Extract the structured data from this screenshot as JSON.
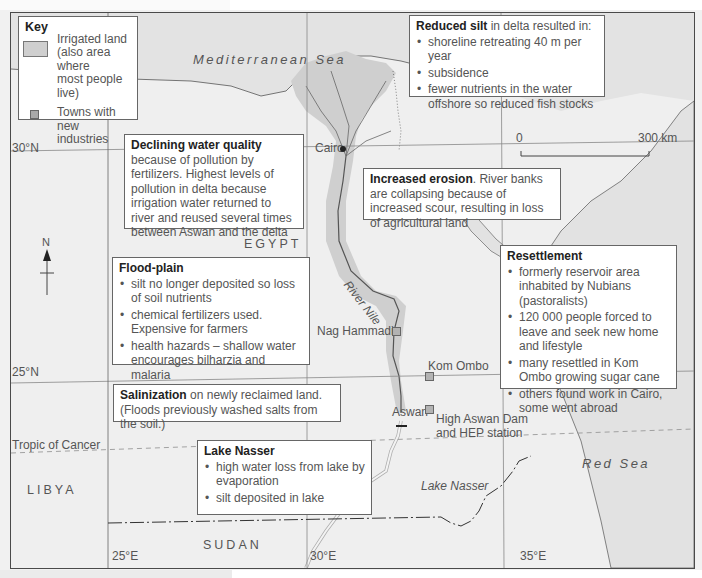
{
  "page": {
    "header_fragment": "...g... p... y... p... g..."
  },
  "key": {
    "title": "Key",
    "items": [
      {
        "label_lines": [
          "Irrigated land",
          "(also area where",
          "most people live)"
        ],
        "swatch": "irrigated-land",
        "color": "#cfcfcf"
      },
      {
        "label_lines": [
          "Towns with new",
          "industries"
        ],
        "swatch": "town-square",
        "color": "#a8a8a8"
      }
    ]
  },
  "map": {
    "seas": {
      "mediterranean": "Mediterranean Sea",
      "red": "Red Sea",
      "lake_nasser": "Lake Nasser"
    },
    "countries": {
      "egypt": "EGYPT",
      "libya": "LIBYA",
      "sudan": "SUDAN"
    },
    "river_label": "River Nile",
    "latitudes": {
      "lat30": "30°N",
      "lat25": "25°N",
      "tropic": "Tropic of Cancer"
    },
    "longitudes": {
      "lon25": "25°E",
      "lon30": "30°E",
      "lon35": "35°E"
    },
    "scale": {
      "start": "0",
      "end": "300 km"
    },
    "north_label": "N",
    "places": {
      "cairo": "Cairo",
      "nag_hammadi": "Nag Hammadi",
      "kom_ombo": "Kom Ombo",
      "aswan": "Aswan",
      "dam_line1": "High Aswan Dam",
      "dam_line2": "and HEP station"
    },
    "colors": {
      "irrigated": "#cfcfcf",
      "sea": "#e0e0e0",
      "land": "#efefef",
      "border": "#4a4a4a"
    }
  },
  "annotations": {
    "reduced_silt": {
      "title": "Reduced silt",
      "intro": " in delta resulted in:",
      "bullets": [
        "shoreline retreating 40 m per year",
        "subsidence",
        "fewer nutrients in the water offshore so reduced fish stocks"
      ]
    },
    "declining_water": {
      "title": "Declining water quality",
      "text": " because of pollution by fertilizers. Highest levels of pollution in delta because irrigation water returned to river and reused several times between Aswan and the delta"
    },
    "increased_erosion": {
      "title": "Increased erosion",
      "text": ". River banks are collapsing because of increased scour, resulting in loss of agricultural land"
    },
    "flood_plain": {
      "title": "Flood-plain",
      "bullets": [
        "silt no longer deposited so loss of soil nutrients",
        "chemical fertilizers used. Expensive for farmers",
        "health hazards – shallow water encourages bilharzia and malaria"
      ]
    },
    "resettlement": {
      "title": "Resettlement",
      "bullets": [
        "formerly reservoir area inhabited by Nubians (pastoralists)",
        "120 000 people forced to leave and seek new home and lifestyle",
        "many resettled in Kom Ombo growing sugar cane",
        "others found work in Cairo, some went abroad"
      ]
    },
    "salinization": {
      "title": "Salinization",
      "text": " on newly reclaimed land. (Floods previously washed salts from the soil.)"
    },
    "lake_nasser": {
      "title": "Lake Nasser",
      "bullets": [
        "high water loss from lake by evaporation",
        "silt deposited in lake"
      ]
    }
  }
}
